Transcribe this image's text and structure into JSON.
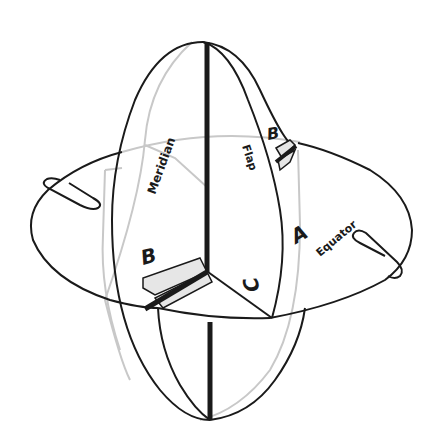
{
  "diagram": {
    "labels": {
      "meridian": "Meridian",
      "flap": "Flap",
      "equator": "Equator",
      "a": "A",
      "b_left": "B",
      "b_right": "B",
      "c": "C"
    },
    "components": [
      "meridian-disc",
      "equator-disc",
      "flap",
      "left-paperclip",
      "right-paperclip",
      "slot-b-left",
      "slot-b-right"
    ],
    "colors": {
      "line": "#1a1a1a",
      "hidden_line": "#c8c8c8",
      "slot_fill": "#e6e6e6",
      "background": "#ffffff"
    }
  }
}
